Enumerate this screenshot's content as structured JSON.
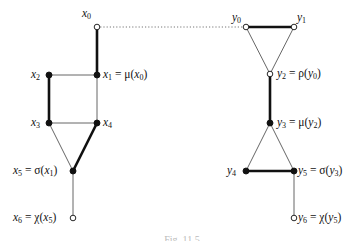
{
  "diagram": {
    "caption": "Fig. 11.5",
    "left_graph": {
      "name": "x-graph",
      "nodes": [
        {
          "id": "x0",
          "x": 97,
          "y": 27,
          "filled": false,
          "label": "x0",
          "label_pos": "above-left"
        },
        {
          "id": "x1",
          "x": 97,
          "y": 75,
          "filled": true,
          "label": "x1 = μ(x0)",
          "label_pos": "right"
        },
        {
          "id": "x2",
          "x": 49,
          "y": 75,
          "filled": true,
          "label": "x2",
          "label_pos": "left"
        },
        {
          "id": "x3",
          "x": 49,
          "y": 123,
          "filled": true,
          "label": "x3",
          "label_pos": "left"
        },
        {
          "id": "x4",
          "x": 97,
          "y": 123,
          "filled": true,
          "label": "x4",
          "label_pos": "right"
        },
        {
          "id": "x5",
          "x": 73,
          "y": 171,
          "filled": true,
          "label": "x5 = σ(x1)",
          "label_pos": "left"
        },
        {
          "id": "x6",
          "x": 73,
          "y": 218,
          "filled": false,
          "label": "x6 = χ(x5)",
          "label_pos": "left"
        }
      ],
      "edges": [
        {
          "from": "x0",
          "to": "x1",
          "style": "thick"
        },
        {
          "from": "x1",
          "to": "x2",
          "style": "thin"
        },
        {
          "from": "x2",
          "to": "x3",
          "style": "thick"
        },
        {
          "from": "x1",
          "to": "x4",
          "style": "thin"
        },
        {
          "from": "x3",
          "to": "x4",
          "style": "thin"
        },
        {
          "from": "x3",
          "to": "x5",
          "style": "thin"
        },
        {
          "from": "x4",
          "to": "x5",
          "style": "thick"
        },
        {
          "from": "x5",
          "to": "x6",
          "style": "thin"
        }
      ]
    },
    "right_graph": {
      "name": "y-graph",
      "nodes": [
        {
          "id": "y0",
          "x": 246,
          "y": 27,
          "filled": false,
          "label": "y0",
          "label_pos": "above-left"
        },
        {
          "id": "y1",
          "x": 294,
          "y": 27,
          "filled": false,
          "label": "y1",
          "label_pos": "above-right"
        },
        {
          "id": "y2",
          "x": 270,
          "y": 74,
          "filled": false,
          "label": "y2 = ρ(y0)",
          "label_pos": "right"
        },
        {
          "id": "y3",
          "x": 270,
          "y": 123,
          "filled": true,
          "label": "y3 = μ(y2)",
          "label_pos": "right"
        },
        {
          "id": "y4",
          "x": 246,
          "y": 171,
          "filled": true,
          "label": "y4",
          "label_pos": "left"
        },
        {
          "id": "y5",
          "x": 294,
          "y": 171,
          "filled": true,
          "label": "y5 = σ(y3)",
          "label_pos": "right"
        },
        {
          "id": "y6",
          "x": 294,
          "y": 218,
          "filled": false,
          "label": "y6 = χ(y5)",
          "label_pos": "right"
        }
      ],
      "edges": [
        {
          "from": "y0",
          "to": "y1",
          "style": "thick"
        },
        {
          "from": "y0",
          "to": "y2",
          "style": "thin"
        },
        {
          "from": "y1",
          "to": "y2",
          "style": "thin"
        },
        {
          "from": "y2",
          "to": "y3",
          "style": "thick"
        },
        {
          "from": "y3",
          "to": "y4",
          "style": "thin"
        },
        {
          "from": "y3",
          "to": "y5",
          "style": "thin"
        },
        {
          "from": "y4",
          "to": "y5",
          "style": "thick"
        },
        {
          "from": "y5",
          "to": "y6",
          "style": "thin"
        }
      ]
    },
    "connector": {
      "from": "x0",
      "to": "y0",
      "style": "dotted"
    },
    "colors": {
      "stroke": "#111111",
      "thin_stroke": "#555555",
      "dotted": "#666666",
      "background": "#ffffff"
    },
    "labels": {
      "x0": {
        "base": "x",
        "sub": "0",
        "rhs": ""
      },
      "x1": {
        "base": "x",
        "sub": "1",
        "rhs_prefix": " = μ(",
        "rhs_base": "x",
        "rhs_sub": "0",
        "rhs_suffix": ")"
      },
      "x2": {
        "base": "x",
        "sub": "2"
      },
      "x3": {
        "base": "x",
        "sub": "3"
      },
      "x4": {
        "base": "x",
        "sub": "4"
      },
      "x5": {
        "base": "x",
        "sub": "5",
        "rhs_prefix": " = σ(",
        "rhs_base": "x",
        "rhs_sub": "1",
        "rhs_suffix": ")"
      },
      "x6": {
        "base": "x",
        "sub": "6",
        "rhs_prefix": " = χ(",
        "rhs_base": "x",
        "rhs_sub": "5",
        "rhs_suffix": ")"
      },
      "y0": {
        "base": "y",
        "sub": "0"
      },
      "y1": {
        "base": "y",
        "sub": "1"
      },
      "y2": {
        "base": "y",
        "sub": "2",
        "rhs_prefix": " = ρ(",
        "rhs_base": "y",
        "rhs_sub": "0",
        "rhs_suffix": ")"
      },
      "y3": {
        "base": "y",
        "sub": "3",
        "rhs_prefix": " = μ(",
        "rhs_base": "y",
        "rhs_sub": "2",
        "rhs_suffix": ")"
      },
      "y4": {
        "base": "y",
        "sub": "4"
      },
      "y5": {
        "base": "y",
        "sub": "5",
        "rhs_prefix": " = σ(",
        "rhs_base": "y",
        "rhs_sub": "3",
        "rhs_suffix": ")"
      },
      "y6": {
        "base": "y",
        "sub": "6",
        "rhs_prefix": " = χ(",
        "rhs_base": "y",
        "rhs_sub": "5",
        "rhs_suffix": ")"
      }
    }
  }
}
